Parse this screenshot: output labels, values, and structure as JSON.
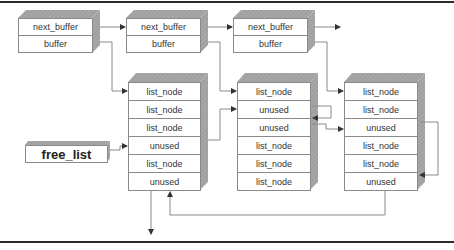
{
  "diagram": {
    "buffers": [
      {
        "cells": [
          "next_buffer",
          "buffer"
        ]
      },
      {
        "cells": [
          "next_buffer",
          "buffer"
        ]
      },
      {
        "cells": [
          "next_buffer",
          "buffer"
        ]
      }
    ],
    "node_columns": [
      {
        "cells": [
          "list_node",
          "list_node",
          "list_node",
          "unused",
          "list_node",
          "unused"
        ]
      },
      {
        "cells": [
          "list_node",
          "unused",
          "unused",
          "list_node",
          "list_node",
          "list_node"
        ]
      },
      {
        "cells": [
          "list_node",
          "list_node",
          "unused",
          "list_node",
          "list_node",
          "unused"
        ]
      }
    ],
    "free_list": {
      "label": "free_list"
    },
    "colors": {
      "face": "#ffffff",
      "side": "#9a9a9a",
      "top": "#b4b4b4",
      "line": "#8a8a8a",
      "arrow": "#333333"
    }
  }
}
